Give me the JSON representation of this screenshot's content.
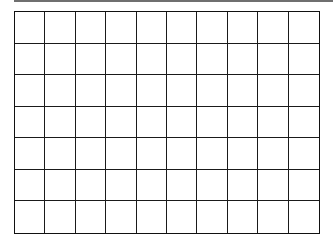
{
  "grid": {
    "rows": 7,
    "columns": 10,
    "line_color": "#1a1a1a",
    "background": "#ffffff",
    "top_bar_color": "#6f6f6f"
  }
}
